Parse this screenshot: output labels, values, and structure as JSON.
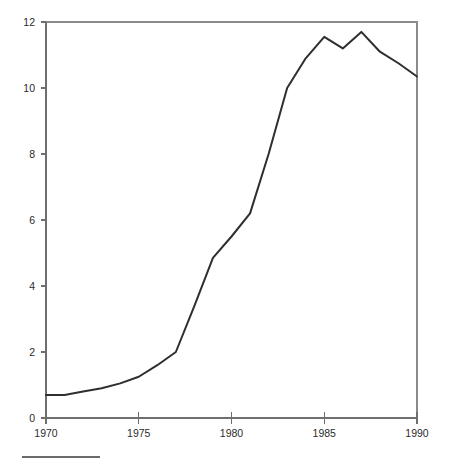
{
  "chart_data": {
    "type": "line",
    "title": "",
    "subtitle": "",
    "xlabel": "",
    "ylabel": "",
    "xlim": [
      1970,
      1990
    ],
    "ylim": [
      0,
      12
    ],
    "grid": false,
    "legend": null,
    "x_ticks": [
      "1970",
      "1975",
      "1980",
      "1985",
      "1990"
    ],
    "x_tick_values": [
      1970,
      1975,
      1980,
      1985,
      1990
    ],
    "y_ticks": [
      "0",
      "2",
      "4",
      "6",
      "8",
      "10",
      "12"
    ],
    "y_tick_values": [
      0,
      2,
      4,
      6,
      8,
      10,
      12
    ],
    "x": [
      1970,
      1971,
      1972,
      1973,
      1974,
      1975,
      1976,
      1977,
      1978,
      1979,
      1980,
      1981,
      1982,
      1983,
      1984,
      1985,
      1986,
      1987,
      1988,
      1989,
      1990
    ],
    "values": [
      0.7,
      0.7,
      0.8,
      0.9,
      1.05,
      1.25,
      1.6,
      2.0,
      3.4,
      4.85,
      5.5,
      6.2,
      8.0,
      10.0,
      10.9,
      11.55,
      11.2,
      11.7,
      11.1,
      10.75,
      10.35
    ],
    "series": [
      {
        "name": "series-1",
        "color": "#2e2e2e",
        "values": [
          0.7,
          0.7,
          0.8,
          0.9,
          1.05,
          1.25,
          1.6,
          2.0,
          3.4,
          4.85,
          5.5,
          6.2,
          8.0,
          10.0,
          10.9,
          11.55,
          11.2,
          11.7,
          11.1,
          10.75,
          10.35
        ]
      }
    ]
  },
  "style": {
    "line_color": "#2e2e2e",
    "axis_color": "#6e6e6e",
    "frame_color": "#8a8a8a",
    "text_color": "#2b2b2b",
    "background": "#ffffff",
    "footer_rule_color": "#6b6b6b"
  },
  "footer": {
    "rule_present": true
  }
}
